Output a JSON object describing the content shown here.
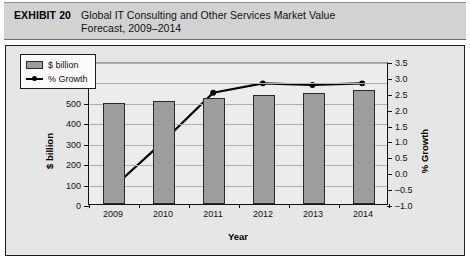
{
  "header": {
    "exhibit_label": "EXHIBIT 20",
    "title_line1": "Global IT Consulting and Other Services Market Value",
    "title_line2": "Forecast, 2009–2014"
  },
  "legend": {
    "position": "top-left-inside",
    "items": [
      {
        "marker": "bar-swatch",
        "label": "$ billion"
      },
      {
        "marker": "line-marker",
        "label": "% Growth"
      }
    ]
  },
  "colors": {
    "bar_fill": "#9d9d9d",
    "bar_stroke": "#2a2a2a",
    "line": "#000000",
    "panel_bg": "#e6e6e6",
    "plot_bg": "#ececec",
    "header_bg": "#d2d2d2",
    "gridline": "#b0b0b0"
  },
  "chart_data": {
    "type": "bar",
    "title": "Global IT Consulting and Other Services Market Value Forecast, 2009–2014",
    "xlabel": "Year",
    "ylabel": "$ billion",
    "y2label": "% Growth",
    "categories": [
      "2009",
      "2010",
      "2011",
      "2012",
      "2013",
      "2014"
    ],
    "ylim": [
      0,
      700
    ],
    "yticks": [
      0,
      100,
      200,
      300,
      400,
      500,
      600,
      700
    ],
    "ytick_labels": [
      "0",
      "100",
      "200",
      "300",
      "400",
      "500",
      "600",
      "700"
    ],
    "y2lim": [
      -1.0,
      3.5
    ],
    "y2ticks": [
      -1.0,
      -0.5,
      0.0,
      0.5,
      1.0,
      1.5,
      2.0,
      2.5,
      3.0,
      3.5
    ],
    "y2tick_labels": [
      "–1.0",
      "–0.5",
      "0.0",
      "0.5",
      "1.0",
      "1.5",
      "2.0",
      "2.5",
      "3.0",
      "3.5"
    ],
    "grid": true,
    "legend_position": "upper left",
    "series": [
      {
        "name": "$ billion",
        "type": "bar",
        "axis": "left",
        "values": [
          495,
          505,
          520,
          535,
          545,
          560
        ]
      },
      {
        "name": "% Growth",
        "type": "line",
        "axis": "right",
        "values": [
          -0.45,
          1.0,
          2.55,
          2.85,
          2.8,
          2.85
        ]
      }
    ]
  }
}
